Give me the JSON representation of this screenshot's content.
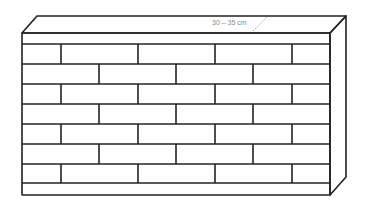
{
  "diagram": {
    "dimension_label": "30 – 35 cm",
    "rows": 8,
    "colors": {
      "stroke": "#222222",
      "label": "#888888",
      "background": "#ffffff"
    }
  }
}
